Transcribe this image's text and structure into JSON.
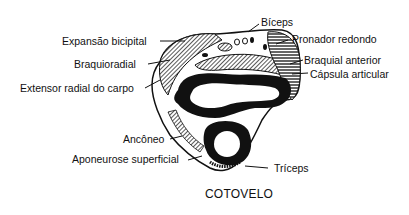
{
  "diagram": {
    "caption": "COTOVELO",
    "labels_left": [
      {
        "id": "expansao-bicipital",
        "text": "Expansão bicipital"
      },
      {
        "id": "braquioradial",
        "text": "Braquioradial"
      },
      {
        "id": "extensor-radial-do-carpo",
        "text": "Extensor radial do carpo"
      },
      {
        "id": "anconeo",
        "text": "Ancôneo"
      },
      {
        "id": "aponeurose-superficial",
        "text": "Aponeurose superficial"
      }
    ],
    "labels_right": [
      {
        "id": "biceps",
        "text": "Bíceps"
      },
      {
        "id": "pronador-redondo",
        "text": "Pronador redondo"
      },
      {
        "id": "braquial-anterior",
        "text": "Braquial anterior"
      },
      {
        "id": "capsula-articular",
        "text": "Cápsula articular"
      },
      {
        "id": "triceps",
        "text": "Tríceps"
      }
    ],
    "colors": {
      "ink": "#111111",
      "background": "#ffffff"
    }
  }
}
